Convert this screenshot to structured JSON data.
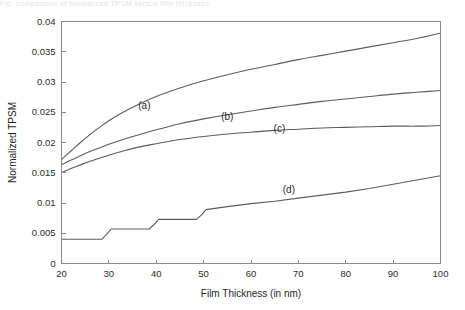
{
  "figure": {
    "background_color": "#ffffff",
    "curve_color": "#5c5c5c",
    "axis_color": "#8a8a8a",
    "text_color": "#1f1f1f",
    "cropped_caption_artifact": "Fig. comparison of normalized TPSM versus film thickness"
  },
  "chart_data": {
    "type": "line",
    "title": "",
    "subtitle": "",
    "xlabel": "Film Thickness (in nm)",
    "ylabel": "Normalized TPSM",
    "xlim": [
      20,
      100
    ],
    "ylim": [
      0,
      0.04
    ],
    "xticks": [
      20,
      30,
      40,
      50,
      60,
      70,
      80,
      90,
      100
    ],
    "xticklabels": [
      "20",
      "30",
      "40",
      "50",
      "60",
      "70",
      "80",
      "90",
      "100"
    ],
    "yticks": [
      0,
      0.005,
      0.01,
      0.015,
      0.02,
      0.025,
      0.03,
      0.035,
      0.04
    ],
    "yticklabels": [
      "0",
      "0.005",
      "0.01",
      "0.015",
      "0.02",
      "0.025",
      "0.03",
      "0.035",
      "0.04"
    ],
    "grid": false,
    "legend": "none",
    "annotations": [
      {
        "text": "(a)",
        "x": 37.5,
        "y": 0.0255
      },
      {
        "text": "(b)",
        "x": 55.0,
        "y": 0.0238
      },
      {
        "text": "(c)",
        "x": 66.0,
        "y": 0.0218
      },
      {
        "text": "(d)",
        "x": 68.0,
        "y": 0.0116
      }
    ],
    "series": [
      {
        "name": "(a)",
        "label": "(a)",
        "x": [
          20,
          22,
          24,
          26,
          28,
          30,
          33,
          36,
          40,
          45,
          50,
          55,
          60,
          65,
          70,
          75,
          80,
          85,
          90,
          95,
          100
        ],
        "values": [
          0.0172,
          0.0186,
          0.02,
          0.0213,
          0.0225,
          0.0236,
          0.025,
          0.0262,
          0.0276,
          0.029,
          0.0302,
          0.0312,
          0.0321,
          0.0329,
          0.0337,
          0.0344,
          0.0351,
          0.0358,
          0.0365,
          0.0372,
          0.0381
        ]
      },
      {
        "name": "(b)",
        "label": "(b)",
        "x": [
          20,
          22,
          24,
          26,
          28,
          30,
          33,
          36,
          40,
          45,
          50,
          55,
          60,
          65,
          70,
          75,
          80,
          85,
          90,
          95,
          100
        ],
        "values": [
          0.0163,
          0.0171,
          0.0178,
          0.0185,
          0.0191,
          0.0197,
          0.0205,
          0.0212,
          0.0221,
          0.0231,
          0.0239,
          0.0246,
          0.0252,
          0.0258,
          0.0263,
          0.0268,
          0.0272,
          0.0276,
          0.028,
          0.0283,
          0.0286
        ]
      },
      {
        "name": "(c)",
        "label": "(c)",
        "x": [
          20,
          22,
          24,
          26,
          28,
          30,
          33,
          36,
          40,
          45,
          50,
          55,
          60,
          65,
          70,
          75,
          80,
          85,
          90,
          95,
          100
        ],
        "values": [
          0.015,
          0.0157,
          0.0163,
          0.0169,
          0.0174,
          0.0179,
          0.0186,
          0.0192,
          0.0198,
          0.0205,
          0.021,
          0.0214,
          0.0217,
          0.022,
          0.0222,
          0.0224,
          0.0225,
          0.0226,
          0.0227,
          0.0227,
          0.0228
        ]
      },
      {
        "name": "(d)",
        "label": "(d)",
        "note": "staircase steps at 30, 40 and 50 nm then smooth rise",
        "x": [
          20,
          28.5,
          29.5,
          30.5,
          38.5,
          39.5,
          40.5,
          48.5,
          49.5,
          50.5,
          55,
          60,
          65,
          70,
          75,
          80,
          85,
          90,
          95,
          100
        ],
        "values": [
          0.004,
          0.004,
          0.0048,
          0.0057,
          0.0057,
          0.0064,
          0.0073,
          0.0073,
          0.008,
          0.0089,
          0.0094,
          0.0099,
          0.0103,
          0.0108,
          0.0113,
          0.0118,
          0.0124,
          0.0131,
          0.0138,
          0.0145
        ]
      }
    ]
  }
}
